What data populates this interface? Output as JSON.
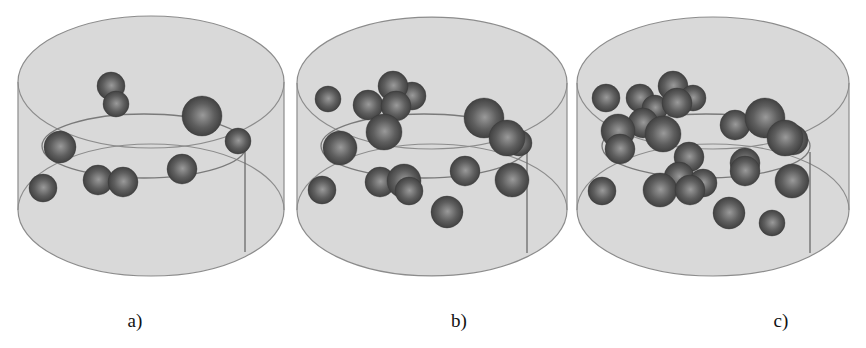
{
  "figure": {
    "colors": {
      "background": "#ffffff",
      "cylinder_fill": "#d9d9d9",
      "cylinder_stroke": "#8c8c8c",
      "inner_line": "#7a7a7a",
      "sphere_dark": "#3a3a3a",
      "sphere_mid": "#5e5e5e",
      "sphere_light": "#9a9a9a"
    },
    "panels": [
      {
        "id": "a",
        "caption": "a)",
        "caption_x": 135,
        "cylinder": {
          "cx": 151,
          "rx": 133,
          "top_cy": 82,
          "bottom_cy": 210,
          "ry": 66,
          "inner": {
            "cx": 144,
            "cy": 146,
            "rx": 102,
            "ry": 32
          },
          "vline": {
            "x": 245,
            "y1": 152,
            "y2": 252
          }
        },
        "spheres": [
          {
            "x": 111,
            "y": 86,
            "r": 14
          },
          {
            "x": 116,
            "y": 104,
            "r": 13
          },
          {
            "x": 202,
            "y": 116,
            "r": 20
          },
          {
            "x": 238,
            "y": 141,
            "r": 13
          },
          {
            "x": 60,
            "y": 147,
            "r": 16
          },
          {
            "x": 43,
            "y": 188,
            "r": 14
          },
          {
            "x": 98,
            "y": 180,
            "r": 15
          },
          {
            "x": 123,
            "y": 182,
            "r": 15
          },
          {
            "x": 182,
            "y": 169,
            "r": 15
          }
        ]
      },
      {
        "id": "b",
        "caption": "b)",
        "caption_x": 459,
        "cylinder": {
          "cx": 432,
          "rx": 135,
          "top_cy": 83,
          "bottom_cy": 210,
          "ry": 66,
          "inner": {
            "cx": 424,
            "cy": 146,
            "rx": 103,
            "ry": 32
          },
          "vline": {
            "x": 527,
            "y1": 152,
            "y2": 253
          }
        },
        "spheres": [
          {
            "x": 328,
            "y": 99,
            "r": 13
          },
          {
            "x": 412,
            "y": 96,
            "r": 14
          },
          {
            "x": 393,
            "y": 86,
            "r": 15
          },
          {
            "x": 368,
            "y": 105,
            "r": 15
          },
          {
            "x": 396,
            "y": 106,
            "r": 15
          },
          {
            "x": 384,
            "y": 132,
            "r": 18
          },
          {
            "x": 484,
            "y": 118,
            "r": 20
          },
          {
            "x": 519,
            "y": 143,
            "r": 13
          },
          {
            "x": 507,
            "y": 138,
            "r": 18
          },
          {
            "x": 340,
            "y": 148,
            "r": 17
          },
          {
            "x": 322,
            "y": 190,
            "r": 14
          },
          {
            "x": 380,
            "y": 182,
            "r": 15
          },
          {
            "x": 404,
            "y": 181,
            "r": 17
          },
          {
            "x": 409,
            "y": 191,
            "r": 14
          },
          {
            "x": 465,
            "y": 171,
            "r": 15
          },
          {
            "x": 512,
            "y": 180,
            "r": 17
          },
          {
            "x": 447,
            "y": 212,
            "r": 16
          }
        ]
      },
      {
        "id": "c",
        "caption": "c)",
        "caption_x": 781,
        "cylinder": {
          "cx": 713,
          "rx": 136,
          "top_cy": 83,
          "bottom_cy": 210,
          "ry": 66,
          "inner": {
            "cx": 706,
            "cy": 146,
            "rx": 104,
            "ry": 32
          },
          "vline": {
            "x": 810,
            "y1": 152,
            "y2": 253
          }
        },
        "spheres": [
          {
            "x": 606,
            "y": 98,
            "r": 14
          },
          {
            "x": 640,
            "y": 98,
            "r": 14
          },
          {
            "x": 655,
            "y": 108,
            "r": 13
          },
          {
            "x": 673,
            "y": 86,
            "r": 15
          },
          {
            "x": 693,
            "y": 98,
            "r": 13
          },
          {
            "x": 677,
            "y": 103,
            "r": 15
          },
          {
            "x": 643,
            "y": 123,
            "r": 15
          },
          {
            "x": 663,
            "y": 134,
            "r": 18
          },
          {
            "x": 618,
            "y": 131,
            "r": 17
          },
          {
            "x": 620,
            "y": 149,
            "r": 15
          },
          {
            "x": 735,
            "y": 125,
            "r": 15
          },
          {
            "x": 765,
            "y": 118,
            "r": 20
          },
          {
            "x": 793,
            "y": 140,
            "r": 15
          },
          {
            "x": 785,
            "y": 138,
            "r": 18
          },
          {
            "x": 689,
            "y": 157,
            "r": 15
          },
          {
            "x": 745,
            "y": 163,
            "r": 15
          },
          {
            "x": 745,
            "y": 171,
            "r": 15
          },
          {
            "x": 679,
            "y": 177,
            "r": 15
          },
          {
            "x": 703,
            "y": 183,
            "r": 14
          },
          {
            "x": 660,
            "y": 190,
            "r": 17
          },
          {
            "x": 690,
            "y": 190,
            "r": 15
          },
          {
            "x": 602,
            "y": 191,
            "r": 14
          },
          {
            "x": 792,
            "y": 181,
            "r": 17
          },
          {
            "x": 729,
            "y": 213,
            "r": 16
          },
          {
            "x": 772,
            "y": 223,
            "r": 13
          }
        ]
      }
    ]
  }
}
